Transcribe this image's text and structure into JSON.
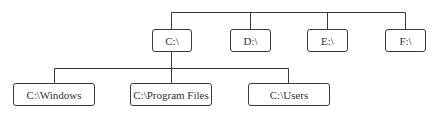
{
  "diagram": {
    "type": "tree",
    "root_level": [
      {
        "id": "c",
        "label": "C:\\"
      },
      {
        "id": "d",
        "label": "D:\\"
      },
      {
        "id": "e",
        "label": "E:\\"
      },
      {
        "id": "f",
        "label": "F:\\"
      }
    ],
    "children_of_c": [
      {
        "id": "c-windows",
        "label": "C:\\Windows"
      },
      {
        "id": "c-program-files",
        "label": "C:\\Program Files"
      },
      {
        "id": "c-users",
        "label": "C:\\Users"
      }
    ],
    "colors": {
      "line": "#3a3a3a",
      "box_border": "#3a3a3a",
      "text": "#333333",
      "background": "#ffffff"
    }
  }
}
